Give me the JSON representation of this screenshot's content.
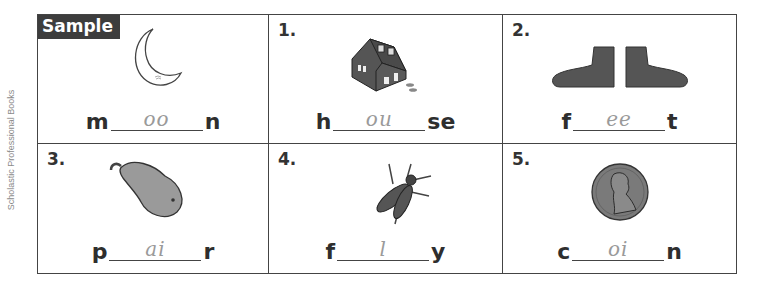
{
  "side_credit": "Scholastic Professional Books",
  "sample_label": "Sample",
  "items": [
    {
      "number": "",
      "picture": "moon",
      "prefix": "m",
      "answer": "oo",
      "suffix": "n"
    },
    {
      "number": "1.",
      "picture": "house",
      "prefix": "h",
      "answer": "ou",
      "suffix": "se"
    },
    {
      "number": "2.",
      "picture": "feet",
      "prefix": "f",
      "answer": "ee",
      "suffix": "t"
    },
    {
      "number": "3.",
      "picture": "pear",
      "prefix": "p",
      "answer": "ai",
      "suffix": "r"
    },
    {
      "number": "4.",
      "picture": "fly",
      "prefix": "f",
      "answer": "l",
      "suffix": "y"
    },
    {
      "number": "5.",
      "picture": "penny-coin",
      "prefix": "c",
      "answer": "oi",
      "suffix": "n"
    }
  ]
}
